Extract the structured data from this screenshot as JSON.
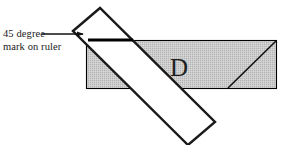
{
  "figure": {
    "title_fragment": "g n  e   g   n   e g",
    "callout": {
      "line1": "45 degree",
      "line2": "mark on ruler"
    },
    "region_label": "D",
    "colors": {
      "paper_fill": "#c9c9c9",
      "paper_stroke": "#000000",
      "ruler_fill": "#ffffff",
      "ruler_stroke": "#1a1a1a",
      "mark_color": "#000000",
      "text_color": "#1a1a1a"
    },
    "geometry": {
      "paper_rect": {
        "x": 86,
        "y": 40,
        "width": 191,
        "height": 49
      },
      "paper_diagonal": {
        "x1": 228,
        "y1": 88,
        "x2": 276,
        "y2": 41
      },
      "ruler_corners": "73,31 100,8 215,122 188,145",
      "degree_mark": {
        "x1": 88,
        "y1": 40,
        "x2": 133,
        "y2": 40
      },
      "arrow": {
        "x1": 42,
        "y1": 34,
        "x2": 84,
        "y2": 34
      },
      "letter_pos": {
        "x": 170,
        "y": 76
      },
      "callout_pos": {
        "x": 3,
        "y": 37
      }
    }
  }
}
